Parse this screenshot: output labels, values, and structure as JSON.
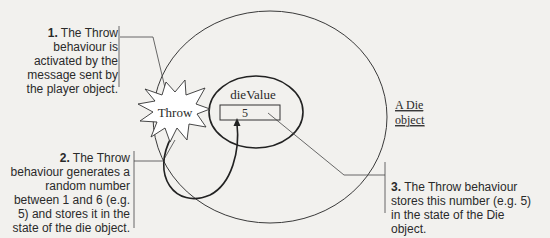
{
  "diagram": {
    "object_label": "A Die object",
    "object_label_line1": "A Die",
    "object_label_line2": "object",
    "behaviour_label": "Throw",
    "attribute_name": "dieValue",
    "attribute_value": "5"
  },
  "notes": [
    {
      "number": "1.",
      "text": " The Throw behaviour is activated by the message sent by the player object."
    },
    {
      "number": "2.",
      "text": " The Throw behaviour generates a random number between 1 and 6 (e.g. 5) and stores it in the state of the die object."
    },
    {
      "number": "3.",
      "text": " The Throw behaviour stores this number (e.g. 5) in the state of the Die object."
    }
  ],
  "colors": {
    "background": "#f2f1ee",
    "line": "#2a2a2a",
    "starburst_fill": "#ffffff"
  }
}
